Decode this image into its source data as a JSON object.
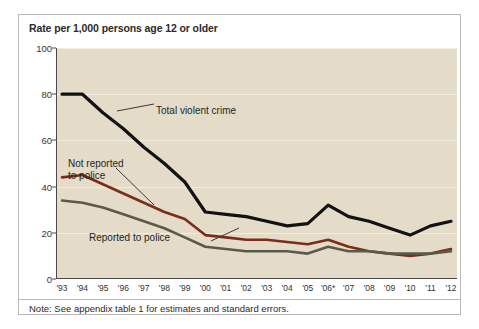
{
  "figure": {
    "title": "Rate per 1,000 persons age 12 or older",
    "note": "Note: See appendix table 1 for estimates and standard errors.",
    "plot_background": "#e4dcc8",
    "frame_color": "#b9b9b9"
  },
  "annotations": {
    "total": "Total violent crime",
    "not_reported": "Not reported\nto police",
    "reported": "Reported to police"
  },
  "chart_data": {
    "type": "line",
    "title": "Rate per 1,000 persons age 12 or older",
    "xlabel": "",
    "ylabel": "Rate per 1,000 persons age 12 or older",
    "ylim": [
      0,
      100
    ],
    "yticks": [
      0,
      20,
      40,
      60,
      80,
      100
    ],
    "grid": true,
    "legend_position": "inline-annotations",
    "note": "Note: See appendix table 1 for estimates and standard errors.",
    "categories": [
      "'93",
      "'94",
      "'95",
      "'96",
      "'97",
      "'98",
      "'99",
      "'00",
      "'01",
      "'02",
      "'03",
      "'04",
      "'05",
      "'06*",
      "'07",
      "'08",
      "'09",
      "'10",
      "'11",
      "'12"
    ],
    "series": [
      {
        "name": "Total violent crime",
        "color": "#121212",
        "width": 3.2,
        "values": [
          80,
          80,
          72,
          65,
          57,
          50,
          42,
          29,
          28,
          27,
          25,
          23,
          24,
          32,
          27,
          25,
          22,
          19,
          23,
          25
        ]
      },
      {
        "name": "Not reported to police",
        "color": "#7c2d18",
        "width": 2.6,
        "values": [
          44,
          45,
          41,
          37,
          33,
          29,
          26,
          19,
          18,
          17,
          17,
          16,
          15,
          17,
          14,
          12,
          11,
          10,
          11,
          13
        ]
      },
      {
        "name": "Reported to police",
        "color": "#5b5a4a",
        "width": 2.6,
        "values": [
          34,
          33,
          31,
          28,
          25,
          22,
          18,
          14,
          13,
          12,
          12,
          12,
          11,
          14,
          12,
          12,
          11,
          11,
          11,
          12
        ]
      }
    ]
  }
}
